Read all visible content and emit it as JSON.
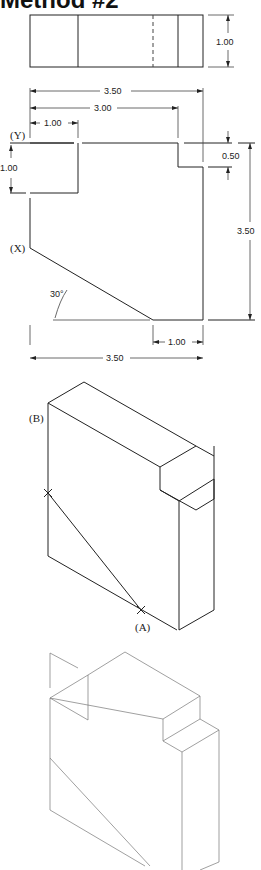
{
  "title": "Method #2",
  "top_view": {
    "height_dim": "1.00"
  },
  "front_view": {
    "overall_width_top": "3.50",
    "width_to_step": "3.00",
    "notch_width": "1.00",
    "notch_depth": "1.00",
    "step_depth": "0.50",
    "overall_height": "3.50",
    "bottom_flat": "1.00",
    "overall_width_bottom": "3.50",
    "angle": "30°",
    "point_y": "(Y)",
    "point_x": "(X)"
  },
  "isometric_view": {
    "point_b": "(B)",
    "point_a": "(A)"
  }
}
